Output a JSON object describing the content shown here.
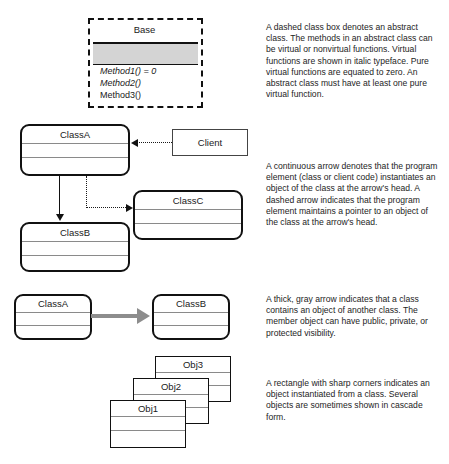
{
  "diagram": {
    "colors": {
      "line": "#111111",
      "compartment_rule": "#8a8a8a",
      "shaded_compartment": "#d4d4d4",
      "aggregation_arrow": "#8d8d8d",
      "background": "#ffffff"
    }
  },
  "abstract_class": {
    "name": "Base",
    "methods": [
      {
        "label": "Method1() = 0",
        "italic": true
      },
      {
        "label": "Method2()",
        "italic": true
      },
      {
        "label": "Method3()",
        "italic": false
      }
    ]
  },
  "arrows_example": {
    "classes": [
      {
        "name": "ClassA"
      },
      {
        "name": "ClassB"
      },
      {
        "name": "ClassC"
      }
    ],
    "client": {
      "name": "Client"
    }
  },
  "containment_example": {
    "source": "ClassA",
    "target": "ClassB"
  },
  "objects_example": {
    "objects": [
      "Obj3",
      "Obj2",
      "Obj1"
    ]
  },
  "notes": [
    "A dashed class box denotes an abstract class. The methods in an abstract class can be virtual or nonvirtual functions. Virtual functions are shown in italic typeface. Pure virtual functions are equated to zero. An abstract class must have at least one pure virtual function.",
    "A continuous arrow denotes that the program element (class or client code) instantiates an object of the class at the arrow's head. A dashed arrow indicates that the program element maintains a pointer to an object of the class at the arrow's head.",
    "A thick, gray arrow indicates that a class contains an object of another class. The member object can have public, private, or protected visibility.",
    "A rectangle with sharp corners indicates an object instantiated from a class. Several objects are sometimes shown in cascade form."
  ]
}
